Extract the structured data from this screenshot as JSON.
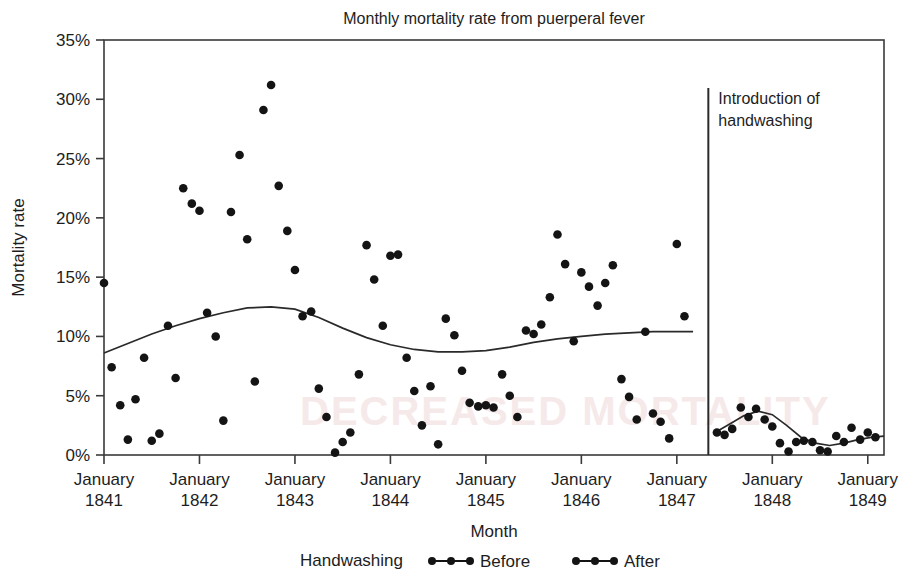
{
  "chart_data": {
    "type": "scatter",
    "title": "Monthly mortality rate from puerperal fever",
    "xlabel": "Month",
    "ylabel": "Mortality rate",
    "ylim": [
      0,
      35
    ],
    "yticks": [
      0,
      5,
      10,
      15,
      20,
      25,
      30,
      35
    ],
    "ytick_labels": [
      "0%",
      "5%",
      "10%",
      "15%",
      "20%",
      "25%",
      "30%",
      "35%"
    ],
    "xlim": [
      1841.0,
      1849.17
    ],
    "xticks": [
      1841,
      1842,
      1843,
      1844,
      1845,
      1846,
      1847,
      1848,
      1849
    ],
    "xtick_labels": [
      [
        "January",
        "1841"
      ],
      [
        "January",
        "1842"
      ],
      [
        "January",
        "1843"
      ],
      [
        "January",
        "1844"
      ],
      [
        "January",
        "1845"
      ],
      [
        "January",
        "1846"
      ],
      [
        "January",
        "1847"
      ],
      [
        "January",
        "1848"
      ],
      [
        "January",
        "1849"
      ]
    ],
    "grid": false,
    "legend_position": "bottom",
    "legend_title": "Handwashing",
    "annotation": {
      "text_line1": "Introduction of",
      "text_line2": "handwashing",
      "x_value": 1847.33
    },
    "series": [
      {
        "name": "Before",
        "marker": "filled-circle",
        "color": "#141414",
        "points": [
          [
            1841.0,
            14.5
          ],
          [
            1841.08,
            7.4
          ],
          [
            1841.17,
            4.2
          ],
          [
            1841.25,
            1.3
          ],
          [
            1841.33,
            4.7
          ],
          [
            1841.42,
            8.2
          ],
          [
            1841.5,
            1.2
          ],
          [
            1841.58,
            1.8
          ],
          [
            1841.67,
            10.9
          ],
          [
            1841.75,
            6.5
          ],
          [
            1841.83,
            22.5
          ],
          [
            1841.92,
            21.2
          ],
          [
            1842.0,
            20.6
          ],
          [
            1842.08,
            12.0
          ],
          [
            1842.17,
            10.0
          ],
          [
            1842.25,
            2.9
          ],
          [
            1842.33,
            20.5
          ],
          [
            1842.42,
            25.3
          ],
          [
            1842.5,
            18.2
          ],
          [
            1842.58,
            6.2
          ],
          [
            1842.67,
            29.1
          ],
          [
            1842.75,
            31.2
          ],
          [
            1842.83,
            22.7
          ],
          [
            1842.92,
            18.9
          ],
          [
            1843.0,
            15.6
          ],
          [
            1843.08,
            11.7
          ],
          [
            1843.17,
            12.1
          ],
          [
            1843.25,
            5.6
          ],
          [
            1843.33,
            3.2
          ],
          [
            1843.42,
            0.2
          ],
          [
            1843.5,
            1.1
          ],
          [
            1843.58,
            1.9
          ],
          [
            1843.67,
            6.8
          ],
          [
            1843.75,
            17.7
          ],
          [
            1843.83,
            14.8
          ],
          [
            1843.92,
            10.9
          ],
          [
            1844.0,
            16.8
          ],
          [
            1844.08,
            16.9
          ],
          [
            1844.17,
            8.2
          ],
          [
            1844.25,
            5.4
          ],
          [
            1844.33,
            2.5
          ],
          [
            1844.42,
            5.8
          ],
          [
            1844.5,
            0.9
          ],
          [
            1844.58,
            11.5
          ],
          [
            1844.67,
            10.1
          ],
          [
            1844.75,
            7.1
          ],
          [
            1844.83,
            4.4
          ],
          [
            1844.92,
            4.1
          ],
          [
            1845.0,
            4.2
          ],
          [
            1845.08,
            4.0
          ],
          [
            1845.17,
            6.8
          ],
          [
            1845.25,
            5.0
          ],
          [
            1845.33,
            3.2
          ],
          [
            1845.42,
            10.5
          ],
          [
            1845.5,
            10.2
          ],
          [
            1845.58,
            11.0
          ],
          [
            1845.67,
            13.3
          ],
          [
            1845.75,
            18.6
          ],
          [
            1845.83,
            16.1
          ],
          [
            1845.92,
            9.6
          ],
          [
            1846.0,
            15.4
          ],
          [
            1846.08,
            14.2
          ],
          [
            1846.17,
            12.6
          ],
          [
            1846.25,
            14.5
          ],
          [
            1846.33,
            16.0
          ],
          [
            1846.42,
            6.4
          ],
          [
            1846.5,
            4.9
          ],
          [
            1846.58,
            3.0
          ],
          [
            1846.67,
            10.4
          ],
          [
            1846.75,
            3.5
          ],
          [
            1846.83,
            2.8
          ],
          [
            1846.92,
            1.4
          ],
          [
            1847.0,
            17.8
          ],
          [
            1847.08,
            11.7
          ]
        ]
      },
      {
        "name": "After",
        "marker": "filled-circle",
        "color": "#141414",
        "points": [
          [
            1847.42,
            1.9
          ],
          [
            1847.5,
            1.7
          ],
          [
            1847.58,
            2.2
          ],
          [
            1847.67,
            4.0
          ],
          [
            1847.75,
            3.2
          ],
          [
            1847.83,
            3.9
          ],
          [
            1847.92,
            3.0
          ],
          [
            1848.0,
            2.4
          ],
          [
            1848.08,
            1.0
          ],
          [
            1848.17,
            0.3
          ],
          [
            1848.25,
            1.1
          ],
          [
            1848.33,
            1.2
          ],
          [
            1848.42,
            1.1
          ],
          [
            1848.5,
            0.4
          ],
          [
            1848.58,
            0.3
          ],
          [
            1848.67,
            1.6
          ],
          [
            1848.75,
            1.1
          ],
          [
            1848.83,
            2.3
          ],
          [
            1848.92,
            1.3
          ],
          [
            1849.0,
            1.9
          ],
          [
            1849.08,
            1.5
          ]
        ]
      }
    ],
    "trend_before": [
      [
        1841.0,
        8.6
      ],
      [
        1841.25,
        9.4
      ],
      [
        1841.5,
        10.2
      ],
      [
        1841.75,
        10.9
      ],
      [
        1842.0,
        11.5
      ],
      [
        1842.25,
        12.0
      ],
      [
        1842.5,
        12.4
      ],
      [
        1842.75,
        12.5
      ],
      [
        1843.0,
        12.3
      ],
      [
        1843.25,
        11.6
      ],
      [
        1843.5,
        10.7
      ],
      [
        1843.75,
        9.9
      ],
      [
        1844.0,
        9.3
      ],
      [
        1844.25,
        8.9
      ],
      [
        1844.5,
        8.7
      ],
      [
        1844.75,
        8.7
      ],
      [
        1845.0,
        8.8
      ],
      [
        1845.25,
        9.1
      ],
      [
        1845.5,
        9.5
      ],
      [
        1845.75,
        9.8
      ],
      [
        1846.0,
        10.0
      ],
      [
        1846.25,
        10.2
      ],
      [
        1846.5,
        10.3
      ],
      [
        1846.75,
        10.4
      ],
      [
        1847.0,
        10.4
      ],
      [
        1847.17,
        10.4
      ]
    ],
    "trend_after": [
      [
        1847.4,
        1.9
      ],
      [
        1847.55,
        2.6
      ],
      [
        1847.7,
        3.3
      ],
      [
        1847.85,
        3.7
      ],
      [
        1848.0,
        3.4
      ],
      [
        1848.15,
        2.5
      ],
      [
        1848.3,
        1.5
      ],
      [
        1848.45,
        1.0
      ],
      [
        1848.6,
        0.8
      ],
      [
        1848.75,
        1.0
      ],
      [
        1848.9,
        1.3
      ],
      [
        1849.05,
        1.5
      ],
      [
        1849.17,
        1.6
      ]
    ]
  },
  "watermark": "DECREASED MORTALITY"
}
